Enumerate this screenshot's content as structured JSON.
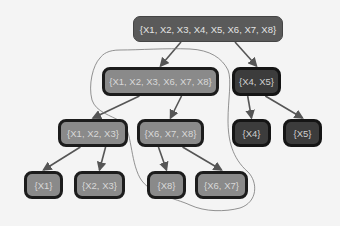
{
  "diagram": {
    "type": "hierarchical clustering tree",
    "nodes": [
      {
        "id": "n0",
        "label": "{X1, X2, X3, X4, X5, X6, X7, X8}",
        "style": "root",
        "x": 133,
        "y": 16,
        "w": 150,
        "h": 26
      },
      {
        "id": "n1",
        "label": "{X1, X2, X3, X6, X7, X8}",
        "style": "light",
        "x": 102,
        "y": 67,
        "w": 117,
        "h": 29
      },
      {
        "id": "n2",
        "label": "{X4, X5}",
        "style": "dark",
        "x": 232,
        "y": 67,
        "w": 49,
        "h": 29
      },
      {
        "id": "n3",
        "label": "{X1, X2, X3}",
        "style": "light",
        "x": 58,
        "y": 119,
        "w": 70,
        "h": 28
      },
      {
        "id": "n4",
        "label": "{X6, X7, X8}",
        "style": "light",
        "x": 137,
        "y": 119,
        "w": 67,
        "h": 28
      },
      {
        "id": "n5",
        "label": "{X4}",
        "style": "dark",
        "x": 232,
        "y": 119,
        "w": 39,
        "h": 28
      },
      {
        "id": "n6",
        "label": "{X5}",
        "style": "dark",
        "x": 283,
        "y": 119,
        "w": 39,
        "h": 28
      },
      {
        "id": "n7",
        "label": "{X1}",
        "style": "light",
        "x": 24,
        "y": 171,
        "w": 39,
        "h": 28
      },
      {
        "id": "n8",
        "label": "{X2, X3}",
        "style": "light",
        "x": 74,
        "y": 171,
        "w": 51,
        "h": 28
      },
      {
        "id": "n9",
        "label": "{X8}",
        "style": "light",
        "x": 147,
        "y": 171,
        "w": 39,
        "h": 28
      },
      {
        "id": "n10",
        "label": "{X6, X7}",
        "style": "light",
        "x": 195,
        "y": 171,
        "w": 53,
        "h": 28
      }
    ],
    "edges": [
      {
        "from": "n0",
        "to": "n1"
      },
      {
        "from": "n0",
        "to": "n2"
      },
      {
        "from": "n1",
        "to": "n3"
      },
      {
        "from": "n1",
        "to": "n4"
      },
      {
        "from": "n2",
        "to": "n5"
      },
      {
        "from": "n2",
        "to": "n6"
      },
      {
        "from": "n3",
        "to": "n7"
      },
      {
        "from": "n3",
        "to": "n8"
      },
      {
        "from": "n4",
        "to": "n9"
      },
      {
        "from": "n4",
        "to": "n10"
      }
    ],
    "annotation": {
      "kind": "hand-drawn lasso",
      "encloses": [
        "n1",
        "n4",
        "n9",
        "n10"
      ]
    },
    "colors": {
      "root": "#5a5a5a",
      "light": "#8a8a8a",
      "dark": "#3c3c3c",
      "edge": "#555555",
      "lasso": "#777777",
      "background": "#f4f4f4"
    }
  }
}
